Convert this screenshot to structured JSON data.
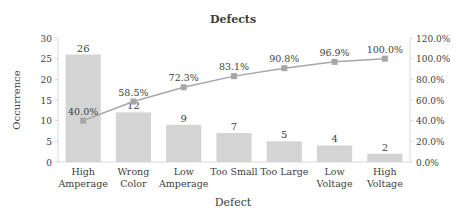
{
  "chart_data": {
    "type": "bar",
    "title": "Defects",
    "xlabel": "Defect",
    "ylabel": "Occurrence",
    "y2label": "",
    "categories": [
      "High Amperage",
      "Wrong Color",
      "Low Amperage",
      "Too Small",
      "Too Large",
      "Low Voltage",
      "High Voltage"
    ],
    "category_lines": [
      [
        "High",
        "Amperage"
      ],
      [
        "Wrong",
        "Color"
      ],
      [
        "Low",
        "Amperage"
      ],
      [
        "Too Small"
      ],
      [
        "Too Large"
      ],
      [
        "Low",
        "Voltage"
      ],
      [
        "High",
        "Voltage"
      ]
    ],
    "series": [
      {
        "name": "Occurrence",
        "type": "bar",
        "axis": "left",
        "values": [
          26,
          12,
          9,
          7,
          5,
          4,
          2
        ],
        "color": "#d4d4d4"
      },
      {
        "name": "Cumulative %",
        "type": "line",
        "axis": "right",
        "values": [
          40.0,
          58.5,
          72.3,
          83.1,
          90.8,
          96.9,
          100.0
        ],
        "labels": [
          "40.0%",
          "58.5%",
          "72.3%",
          "83.1%",
          "90.8%",
          "96.9%",
          "100.0%"
        ],
        "color": "#a6a6a6"
      }
    ],
    "ylim": [
      0,
      30
    ],
    "yticks": [
      0,
      5,
      10,
      15,
      20,
      25,
      30
    ],
    "y2lim": [
      0,
      120
    ],
    "y2ticks": [
      "0.0%",
      "20.0%",
      "40.0%",
      "60.0%",
      "80.0%",
      "100.0%",
      "120.0%"
    ],
    "grid": false,
    "legend": "none"
  }
}
